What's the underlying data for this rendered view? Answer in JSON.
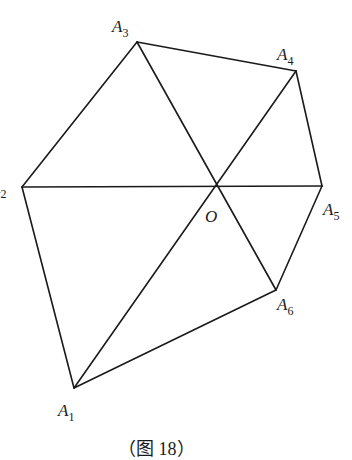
{
  "figure": {
    "caption": "（图 18）",
    "center": {
      "name": "O",
      "x": 218,
      "y": 186
    },
    "points": [
      {
        "id": "A1",
        "base": "A",
        "sub": "1",
        "x": 74,
        "y": 388,
        "lx": 58,
        "ly": 416
      },
      {
        "id": "A2",
        "base": "A",
        "sub": "2",
        "x": 22,
        "y": 187,
        "lx": -10,
        "ly": 193
      },
      {
        "id": "A3",
        "base": "A",
        "sub": "3",
        "x": 137,
        "y": 42,
        "lx": 112,
        "ly": 32
      },
      {
        "id": "A4",
        "base": "A",
        "sub": "4",
        "x": 296,
        "y": 71,
        "lx": 277,
        "ly": 60
      },
      {
        "id": "A5",
        "base": "A",
        "sub": "5",
        "x": 322,
        "y": 186,
        "lx": 323,
        "ly": 215
      },
      {
        "id": "A6",
        "base": "A",
        "sub": "6",
        "x": 276,
        "y": 290,
        "lx": 277,
        "ly": 310
      }
    ],
    "polygon_edges": [
      [
        "A1",
        "A2"
      ],
      [
        "A2",
        "A3"
      ],
      [
        "A3",
        "A4"
      ],
      [
        "A4",
        "A5"
      ],
      [
        "A5",
        "A6"
      ],
      [
        "A6",
        "A1"
      ]
    ],
    "diagonals_through_O": [
      [
        "A1",
        "A4"
      ],
      [
        "A2",
        "A5"
      ],
      [
        "A3",
        "A6"
      ]
    ],
    "line_color": "#1a1a1a"
  }
}
